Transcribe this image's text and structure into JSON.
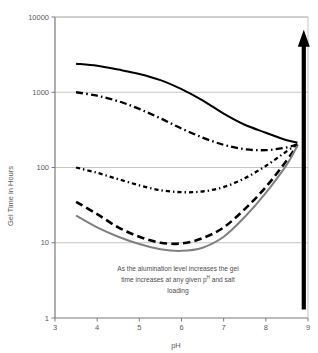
{
  "chart_data": {
    "type": "line",
    "title": "",
    "xlabel": "pH",
    "ylabel": "Gel Time in Hours",
    "xlim": [
      3,
      9
    ],
    "ylim": [
      1,
      10000
    ],
    "yscale": "log",
    "xticks": [
      "3",
      "4",
      "5",
      "6",
      "7",
      "8",
      "9"
    ],
    "yticks": [
      "1",
      "10",
      "100",
      "1000",
      "10000"
    ],
    "grid": "horizontal",
    "legend": "none",
    "series": [
      {
        "name": "highest-alumination",
        "style": "solid-black",
        "color": "#000000",
        "x": [
          3.5,
          4.0,
          4.5,
          5.0,
          5.5,
          6.0,
          6.5,
          7.0,
          7.5,
          8.0,
          8.5,
          8.75
        ],
        "values": [
          2400,
          2250,
          2000,
          1750,
          1450,
          1100,
          780,
          520,
          370,
          290,
          230,
          215
        ]
      },
      {
        "name": "high-alumination",
        "style": "dash-dot-black",
        "color": "#000000",
        "x": [
          3.5,
          4.0,
          4.5,
          5.0,
          5.5,
          6.0,
          6.5,
          7.0,
          7.5,
          8.0,
          8.5,
          8.75
        ],
        "values": [
          1000,
          900,
          760,
          600,
          450,
          330,
          250,
          200,
          175,
          170,
          185,
          205
        ]
      },
      {
        "name": "medium-alumination",
        "style": "dotted-black",
        "color": "#000000",
        "x": [
          3.5,
          4.0,
          4.5,
          5.0,
          5.5,
          6.0,
          6.5,
          7.0,
          7.5,
          8.0,
          8.5,
          8.75
        ],
        "values": [
          100,
          85,
          70,
          58,
          50,
          47,
          48,
          55,
          72,
          105,
          165,
          205
        ]
      },
      {
        "name": "low-alumination",
        "style": "dashed-black",
        "color": "#000000",
        "x": [
          3.5,
          4.0,
          4.5,
          5.0,
          5.5,
          6.0,
          6.5,
          7.0,
          7.5,
          8.0,
          8.5,
          8.75
        ],
        "values": [
          35,
          24,
          16,
          12,
          10,
          9.8,
          11.5,
          16,
          28,
          55,
          125,
          200
        ]
      },
      {
        "name": "no-alumination",
        "style": "solid-gray",
        "color": "#808080",
        "x": [
          3.5,
          4.0,
          4.5,
          5.0,
          5.5,
          6.0,
          6.5,
          7.0,
          7.5,
          8.0,
          8.5,
          8.75
        ],
        "values": [
          23,
          16,
          12,
          9.6,
          8.2,
          7.8,
          8.6,
          12,
          22,
          46,
          110,
          195
        ]
      }
    ],
    "annotations": [
      {
        "name": "trend-arrow",
        "kind": "arrow-up",
        "x": 8.9,
        "from_value": 1.3,
        "to_value": 6000,
        "color": "#000000"
      },
      {
        "name": "explanatory-note",
        "kind": "text",
        "line1": "As the alumination level increases the gel",
        "line2_before": "time increases at any given p",
        "line2_sup": "H",
        "line2_after": " and salt",
        "line3": "loading"
      }
    ]
  },
  "colors": {
    "axis": "#7a7a7a",
    "grid": "#b5b5b5",
    "series_black": "#000000",
    "series_gray": "#808080",
    "text": "#4d4d4d",
    "background": "#ffffff"
  }
}
